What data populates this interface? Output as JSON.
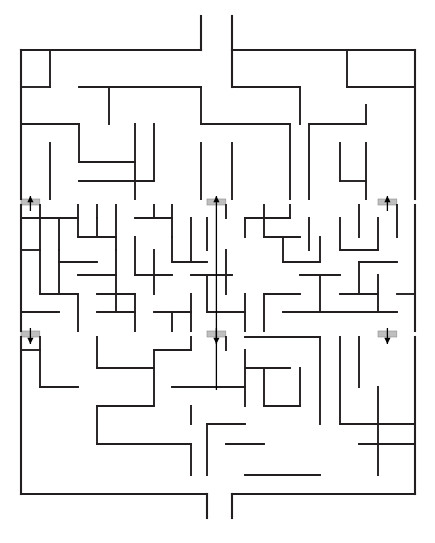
{
  "page": {
    "background_color": "#ffffff",
    "width": 435,
    "height": 543
  },
  "maze": {
    "wall_color": "#231f20",
    "wall_thickness": 1.9,
    "border_thickness": 2.1,
    "gate_fill_color": "#bfbfbf",
    "gate_stroke_color": "#8c8c8c",
    "arrow_color": "#000000",
    "origin_x": 21,
    "origin_y": 50,
    "cell_size": 18.8,
    "cols": 21,
    "rows": 23.6,
    "right_x": 415,
    "bottom_y": 494,
    "entry_label": "top-entrance",
    "exit_label": "bottom-exit",
    "gates": [
      {
        "name": "up-gate-left",
        "x": 21.0,
        "y": 199.0,
        "w": 18.8,
        "h": 6.0,
        "dir": "up"
      },
      {
        "name": "up-gate-center",
        "x": 207.0,
        "y": 199.0,
        "w": 18.8,
        "h": 6.0,
        "dir": "up"
      },
      {
        "name": "up-gate-right",
        "x": 378.0,
        "y": 199.0,
        "w": 18.8,
        "h": 6.0,
        "dir": "up"
      },
      {
        "name": "down-gate-left",
        "x": 21.0,
        "y": 331.0,
        "w": 18.8,
        "h": 6.0,
        "dir": "down"
      },
      {
        "name": "down-gate-center",
        "x": 207.0,
        "y": 331.0,
        "w": 18.8,
        "h": 6.0,
        "dir": "down"
      },
      {
        "name": "down-gate-right",
        "x": 378.0,
        "y": 331.0,
        "w": 18.8,
        "h": 6.0,
        "dir": "down"
      }
    ],
    "arrows": [
      {
        "name": "arrow-up-left",
        "x": 30.4,
        "y1": 211.0,
        "y2": 196.0,
        "dir": "up"
      },
      {
        "name": "arrow-up-center",
        "x": 216.4,
        "y1": 390.0,
        "y2": 196.0,
        "dir": "up"
      },
      {
        "name": "arrow-up-right",
        "x": 387.4,
        "y1": 211.0,
        "y2": 196.0,
        "dir": "up"
      },
      {
        "name": "arrow-down-left",
        "x": 30.4,
        "y1": 328.0,
        "y2": 344.0,
        "dir": "down"
      },
      {
        "name": "arrow-down-center",
        "x": 216.4,
        "y1": 328.0,
        "y2": 344.0,
        "dir": "down"
      },
      {
        "name": "arrow-down-right",
        "x": 387.4,
        "y1": 328.0,
        "y2": 344.0,
        "dir": "down"
      }
    ],
    "border_segments": [
      [
        21,
        50,
        201,
        50
      ],
      [
        232,
        50,
        415,
        50
      ],
      [
        21,
        50,
        21,
        199
      ],
      [
        21,
        205,
        21,
        331
      ],
      [
        21,
        337,
        21,
        494
      ],
      [
        415,
        50,
        415,
        199
      ],
      [
        415,
        205,
        415,
        331
      ],
      [
        415,
        337,
        415,
        494
      ],
      [
        21,
        494,
        207,
        494
      ],
      [
        232,
        494,
        415,
        494
      ]
    ],
    "entry_segments": [
      [
        201,
        16,
        201,
        50
      ],
      [
        232,
        16,
        232,
        87
      ]
    ],
    "exit_segments": [
      [
        207,
        494,
        207,
        518
      ],
      [
        232,
        494,
        232,
        518
      ]
    ],
    "walls": [
      [
        21,
        87,
        50,
        87
      ],
      [
        50,
        50,
        50,
        87
      ],
      [
        79,
        87,
        201,
        87
      ],
      [
        232,
        87,
        300,
        87
      ],
      [
        109,
        87,
        109,
        124
      ],
      [
        21,
        124,
        79,
        124
      ],
      [
        79,
        124,
        79,
        162
      ],
      [
        79,
        162,
        135,
        162
      ],
      [
        50,
        143,
        50,
        199
      ],
      [
        135,
        124,
        135,
        199
      ],
      [
        116,
        162,
        135,
        162
      ],
      [
        79,
        181,
        154,
        181
      ],
      [
        154,
        124,
        154,
        181
      ],
      [
        201,
        87,
        201,
        124
      ],
      [
        201,
        124,
        290,
        124
      ],
      [
        290,
        124,
        290,
        199
      ],
      [
        201,
        143,
        201,
        199
      ],
      [
        232,
        143,
        232,
        199
      ],
      [
        300,
        87,
        300,
        124
      ],
      [
        309,
        124,
        309,
        199
      ],
      [
        309,
        124,
        366,
        124
      ],
      [
        366,
        105,
        366,
        124
      ],
      [
        347,
        50,
        347,
        87
      ],
      [
        347,
        87,
        415,
        87
      ],
      [
        340,
        143,
        340,
        181
      ],
      [
        340,
        181,
        366,
        181
      ],
      [
        366,
        143,
        366,
        199
      ],
      [
        21,
        218,
        78,
        218
      ],
      [
        40,
        205,
        40,
        250
      ],
      [
        59,
        218,
        59,
        250
      ],
      [
        78,
        205,
        78,
        237
      ],
      [
        78,
        237,
        116,
        237
      ],
      [
        97,
        218,
        97,
        237
      ],
      [
        97,
        205,
        97,
        218
      ],
      [
        116,
        205,
        116,
        250
      ],
      [
        135,
        218,
        172,
        218
      ],
      [
        154,
        205,
        154,
        218
      ],
      [
        172,
        205,
        172,
        237
      ],
      [
        21,
        250,
        40,
        250
      ],
      [
        40,
        250,
        40,
        294
      ],
      [
        59,
        262,
        97,
        262
      ],
      [
        59,
        262,
        59,
        294
      ],
      [
        78,
        275,
        116,
        275
      ],
      [
        116,
        250,
        116,
        294
      ],
      [
        97,
        294,
        135,
        294
      ],
      [
        135,
        237,
        135,
        275
      ],
      [
        135,
        275,
        172,
        275
      ],
      [
        154,
        250,
        154,
        294
      ],
      [
        172,
        237,
        172,
        262
      ],
      [
        172,
        262,
        207,
        262
      ],
      [
        191,
        218,
        191,
        262
      ],
      [
        207,
        218,
        207,
        250
      ],
      [
        191,
        275,
        232,
        275
      ],
      [
        191,
        294,
        191,
        331
      ],
      [
        40,
        294,
        78,
        294
      ],
      [
        78,
        294,
        78,
        331
      ],
      [
        21,
        312,
        59,
        312
      ],
      [
        97,
        312,
        135,
        312
      ],
      [
        116,
        294,
        116,
        312
      ],
      [
        135,
        294,
        135,
        331
      ],
      [
        154,
        312,
        191,
        312
      ],
      [
        172,
        312,
        172,
        331
      ],
      [
        207,
        275,
        207,
        312
      ],
      [
        226,
        250,
        226,
        294
      ],
      [
        207,
        312,
        245,
        312
      ],
      [
        245,
        294,
        245,
        331
      ],
      [
        226,
        205,
        226,
        218
      ],
      [
        245,
        218,
        245,
        237
      ],
      [
        245,
        218,
        290,
        218
      ],
      [
        264,
        205,
        264,
        237
      ],
      [
        264,
        237,
        300,
        237
      ],
      [
        283,
        237,
        283,
        262
      ],
      [
        283,
        262,
        320,
        262
      ],
      [
        290,
        205,
        290,
        218
      ],
      [
        309,
        218,
        309,
        250
      ],
      [
        320,
        237,
        320,
        262
      ],
      [
        300,
        275,
        340,
        275
      ],
      [
        320,
        275,
        320,
        312
      ],
      [
        264,
        294,
        300,
        294
      ],
      [
        264,
        294,
        264,
        331
      ],
      [
        283,
        312,
        320,
        312
      ],
      [
        340,
        218,
        340,
        250
      ],
      [
        340,
        250,
        378,
        250
      ],
      [
        359,
        205,
        359,
        237
      ],
      [
        359,
        262,
        397,
        262
      ],
      [
        359,
        262,
        359,
        294
      ],
      [
        378,
        218,
        378,
        250
      ],
      [
        378,
        275,
        378,
        312
      ],
      [
        397,
        205,
        397,
        237
      ],
      [
        340,
        294,
        378,
        294
      ],
      [
        397,
        294,
        415,
        294
      ],
      [
        320,
        312,
        397,
        312
      ],
      [
        21,
        350,
        40,
        350
      ],
      [
        40,
        337,
        40,
        387
      ],
      [
        97,
        337,
        97,
        368
      ],
      [
        97,
        368,
        154,
        368
      ],
      [
        154,
        350,
        154,
        368
      ],
      [
        154,
        350,
        191,
        350
      ],
      [
        191,
        337,
        191,
        350
      ],
      [
        40,
        387,
        78,
        387
      ],
      [
        97,
        406,
        154,
        406
      ],
      [
        97,
        406,
        97,
        444
      ],
      [
        97,
        444,
        191,
        444
      ],
      [
        154,
        368,
        154,
        406
      ],
      [
        172,
        387,
        245,
        387
      ],
      [
        245,
        350,
        245,
        406
      ],
      [
        191,
        444,
        191,
        475
      ],
      [
        191,
        406,
        191,
        424
      ],
      [
        207,
        424,
        207,
        475
      ],
      [
        207,
        424,
        245,
        424
      ],
      [
        226,
        444,
        264,
        444
      ],
      [
        245,
        368,
        290,
        368
      ],
      [
        264,
        368,
        264,
        406
      ],
      [
        264,
        406,
        300,
        406
      ],
      [
        300,
        368,
        300,
        406
      ],
      [
        226,
        337,
        226,
        350
      ],
      [
        245,
        337,
        320,
        337
      ],
      [
        320,
        337,
        320,
        424
      ],
      [
        245,
        475,
        320,
        475
      ],
      [
        340,
        337,
        340,
        424
      ],
      [
        340,
        424,
        415,
        424
      ],
      [
        359,
        337,
        359,
        387
      ],
      [
        378,
        424,
        378,
        475
      ],
      [
        378,
        387,
        378,
        424
      ],
      [
        359,
        444,
        415,
        444
      ],
      [
        59,
        250,
        59,
        262
      ]
    ]
  }
}
